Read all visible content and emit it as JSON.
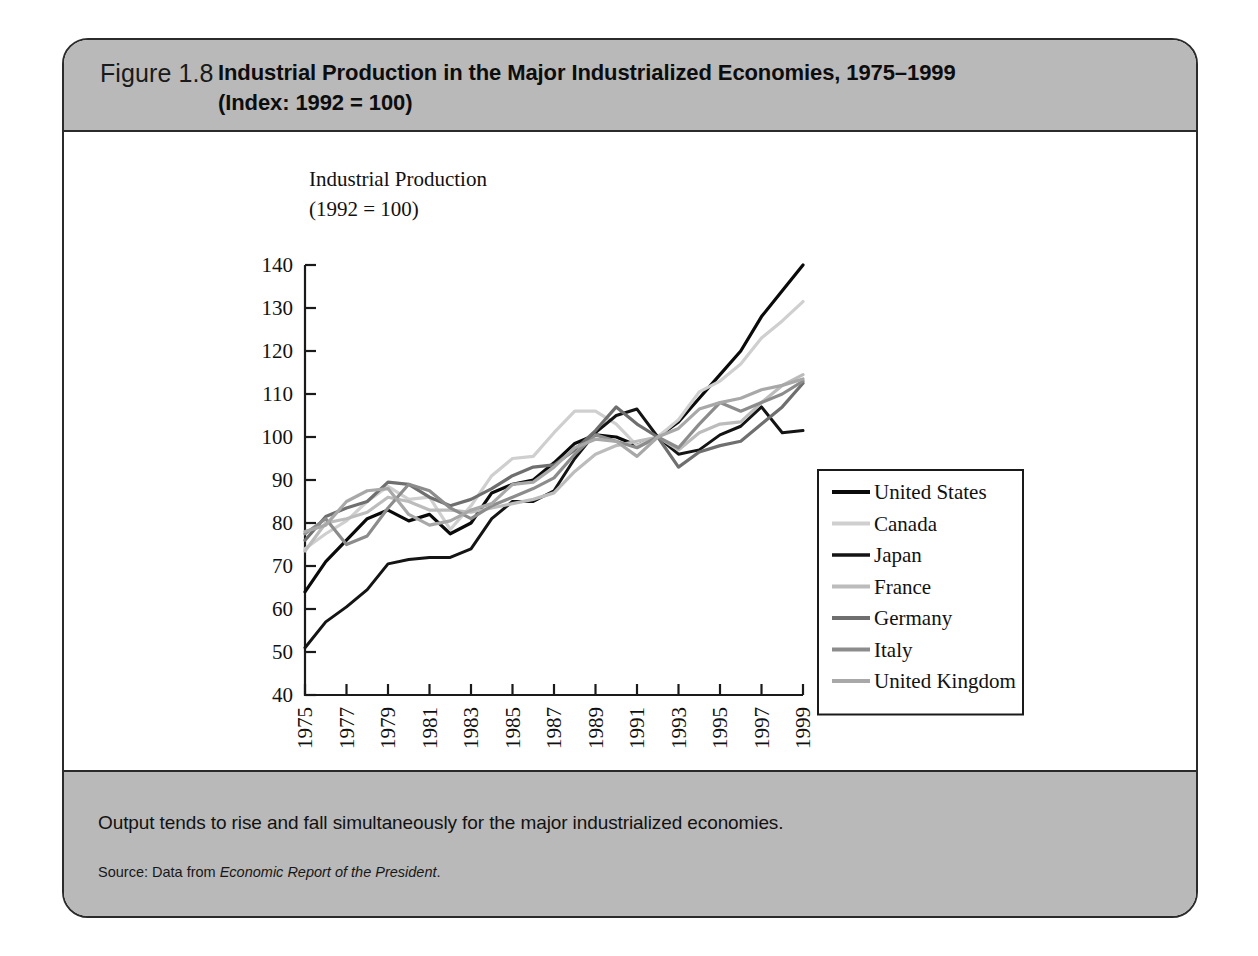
{
  "figure": {
    "number_label": "Figure 1.8",
    "title_line1": "Industrial Production in the Major Industrialized Economies, 1975–1999",
    "title_line2": "(Index: 1992 = 100)",
    "caption": "Output tends to rise and fall simultaneously for the major industrialized economies.",
    "source_prefix": "Source: Data from ",
    "source_italic": "Economic Report of the President",
    "source_suffix": ".",
    "header_bg": "#b9b9b9",
    "footer_bg": "#b9b9b9",
    "border_color": "#2b2b2b"
  },
  "chart_data": {
    "type": "line",
    "title": "Industrial Production in the Major Industrialized Economies, 1975–1999",
    "ylabel_line1": "Industrial Production",
    "ylabel_line2": "(1992 = 100)",
    "xlabel": "Year",
    "ylim": [
      40,
      140
    ],
    "yticks": [
      40,
      50,
      60,
      70,
      80,
      90,
      100,
      110,
      120,
      130,
      140
    ],
    "ytick_labels": [
      "40",
      "50",
      "60",
      "70",
      "80",
      "90",
      "100",
      "110",
      "120",
      "130",
      "140"
    ],
    "xlim": [
      1975,
      1999
    ],
    "x": [
      1975,
      1976,
      1977,
      1978,
      1979,
      1980,
      1981,
      1982,
      1983,
      1984,
      1985,
      1986,
      1987,
      1988,
      1989,
      1990,
      1991,
      1992,
      1993,
      1994,
      1995,
      1996,
      1997,
      1998,
      1999
    ],
    "xticks": [
      1975,
      1977,
      1979,
      1981,
      1983,
      1985,
      1987,
      1989,
      1991,
      1993,
      1995,
      1997,
      1999
    ],
    "xtick_labels": [
      "1975",
      "1977",
      "1979",
      "1981",
      "1983",
      "1985",
      "1987",
      "1989",
      "1991",
      "1993",
      "1995",
      "1997",
      "1999"
    ],
    "xtick_rotation": -90,
    "grid": false,
    "legend_position": "right-middle",
    "series": [
      {
        "name": "United States",
        "color": "#0a0a0a",
        "width": 3.2,
        "values": [
          64,
          71,
          76,
          81,
          83,
          80.5,
          82,
          77.5,
          80,
          87,
          89,
          90,
          94,
          98.5,
          100.5,
          100,
          98,
          100,
          103.5,
          109,
          114.5,
          120,
          128,
          134,
          140
        ]
      },
      {
        "name": "Canada",
        "color": "#cfcfcf",
        "width": 3.2,
        "values": [
          74,
          77.5,
          80.5,
          85,
          88.5,
          85.5,
          86,
          78.5,
          84,
          91,
          95,
          95.5,
          101,
          106,
          106,
          103,
          98,
          100,
          104,
          110.5,
          113,
          117,
          123,
          127,
          131.5
        ]
      },
      {
        "name": "Japan",
        "color": "#141414",
        "width": 3.0,
        "values": [
          51,
          57,
          60.5,
          64.5,
          70.5,
          71.5,
          72,
          72,
          74,
          81,
          85,
          85,
          87.5,
          95,
          101,
          105,
          106.5,
          100,
          96,
          97,
          100.5,
          102.5,
          107,
          101,
          101.5
        ]
      },
      {
        "name": "France",
        "color": "#bcbcbc",
        "width": 3.2,
        "values": [
          73.5,
          80,
          81,
          82.5,
          86,
          85,
          83,
          83,
          82.5,
          83.5,
          84.5,
          85.5,
          87,
          92,
          96,
          98,
          99,
          100,
          97,
          101,
          103,
          103.5,
          108,
          112,
          114.5
        ]
      },
      {
        "name": "Germany",
        "color": "#6f6f6f",
        "width": 3.2,
        "values": [
          76,
          81.5,
          83.5,
          85,
          89.5,
          89,
          86,
          84,
          85.5,
          88,
          91,
          93,
          93.5,
          97,
          101.5,
          107,
          103,
          100,
          93,
          96.5,
          98,
          99,
          103,
          107,
          112.5
        ]
      },
      {
        "name": "Italy",
        "color": "#8c8c8c",
        "width": 3.2,
        "values": [
          77.5,
          81,
          75,
          77,
          83.5,
          89,
          87.5,
          83.5,
          81,
          84,
          86,
          88,
          90.5,
          96,
          100.5,
          99,
          97.5,
          100,
          97.5,
          103,
          108,
          106,
          108,
          110,
          113
        ]
      },
      {
        "name": "United Kingdom",
        "color": "#a8a8a8",
        "width": 3.2,
        "values": [
          78,
          79.5,
          85,
          87.5,
          88,
          82,
          79.5,
          80.5,
          83,
          84.5,
          89,
          89.5,
          93,
          97.5,
          99.5,
          99,
          95.5,
          100,
          102,
          106.5,
          108,
          109,
          111,
          112,
          113.5
        ]
      }
    ]
  }
}
